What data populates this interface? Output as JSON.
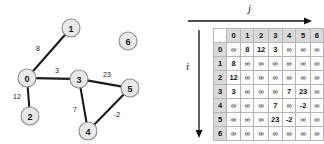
{
  "graph": {
    "nodes": [
      {
        "id": "0",
        "x": 27,
        "y": 78
      },
      {
        "id": "1",
        "x": 71,
        "y": 28
      },
      {
        "id": "2",
        "x": 30,
        "y": 116
      },
      {
        "id": "3",
        "x": 79,
        "y": 79
      },
      {
        "id": "4",
        "x": 88,
        "y": 131
      },
      {
        "id": "5",
        "x": 130,
        "y": 88
      },
      {
        "id": "6",
        "x": 128,
        "y": 41
      }
    ],
    "node_radius": 9,
    "edges": [
      {
        "from": "0",
        "to": "1",
        "weight": "8",
        "lx": 38,
        "ly": 48
      },
      {
        "from": "0",
        "to": "3",
        "weight": "3",
        "lx": 57,
        "ly": 70
      },
      {
        "from": "0",
        "to": "2",
        "weight": "12",
        "lx": 17,
        "ly": 96
      },
      {
        "from": "3",
        "to": "5",
        "weight": "23",
        "lx": 107,
        "ly": 74
      },
      {
        "from": "3",
        "to": "4",
        "weight": "7",
        "lx": 75,
        "ly": 109
      },
      {
        "from": "4",
        "to": "5",
        "weight": "-2",
        "lx": 117,
        "ly": 114
      }
    ]
  },
  "matrix": {
    "axis_row_label": "i",
    "axis_col_label": "j",
    "corner": "",
    "col_headers": [
      "0",
      "1",
      "2",
      "3",
      "4",
      "5",
      "6"
    ],
    "row_headers": [
      "0",
      "1",
      "2",
      "3",
      "4",
      "5",
      "6"
    ],
    "infinity_symbol": "∞",
    "rows": [
      [
        "∞",
        "8",
        "12",
        "3",
        "∞",
        "∞",
        "∞"
      ],
      [
        "8",
        "∞",
        "∞",
        "∞",
        "∞",
        "∞",
        "∞"
      ],
      [
        "12",
        "∞",
        "∞",
        "∞",
        "∞",
        "∞",
        "∞"
      ],
      [
        "3",
        "∞",
        "∞",
        "∞",
        "7",
        "23",
        "∞"
      ],
      [
        "∞",
        "∞",
        "∞",
        "7",
        "∞",
        "-2",
        "∞"
      ],
      [
        "∞",
        "∞",
        "∞",
        "23",
        "-2",
        "∞",
        "∞"
      ],
      [
        "∞",
        "∞",
        "∞",
        "∞",
        "∞",
        "∞",
        "∞"
      ]
    ]
  },
  "colors": {
    "node_fill": "#e8e8e8",
    "node_stroke": "#8a8a8a",
    "edge": "#1c1c1c",
    "header_fill": "#d9d9d9",
    "grid_line": "#b6b6b6",
    "text": "#111111",
    "background": "#ffffff"
  }
}
